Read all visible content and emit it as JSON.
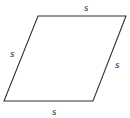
{
  "diagram": {
    "shape": "rhombus",
    "vertices": [
      [
        38,
        16
      ],
      [
        126,
        16
      ],
      [
        93,
        101
      ],
      [
        4,
        101
      ]
    ],
    "stroke_color": "#333333",
    "labels": {
      "top": "s",
      "left": "s",
      "right": "s",
      "bottom": "s"
    }
  }
}
